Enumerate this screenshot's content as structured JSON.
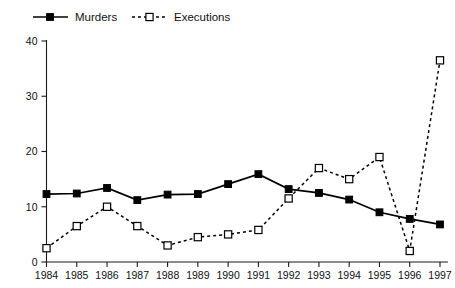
{
  "chart_data": {
    "type": "line",
    "title": "",
    "subtitle": "",
    "xlabel": "",
    "ylabel": "",
    "categories": [
      "1984",
      "1985",
      "1986",
      "1987",
      "1988",
      "1989",
      "1990",
      "1991",
      "1992",
      "1993",
      "1994",
      "1995",
      "1996",
      "1997"
    ],
    "x": [
      1984,
      1985,
      1986,
      1987,
      1988,
      1989,
      1990,
      1991,
      1992,
      1993,
      1994,
      1995,
      1996,
      1997
    ],
    "series": [
      {
        "name": "Murders",
        "marker": "filled-square",
        "linestyle": "solid",
        "values": [
          12.3,
          12.4,
          13.4,
          11.2,
          12.2,
          12.3,
          14.1,
          15.9,
          13.2,
          12.5,
          11.3,
          9.0,
          7.8,
          6.8
        ]
      },
      {
        "name": "Executions",
        "marker": "open-square",
        "linestyle": "dashed",
        "values": [
          2.5,
          6.5,
          10.0,
          6.5,
          3.0,
          4.5,
          5.0,
          5.8,
          11.5,
          17.0,
          15.0,
          19.0,
          2.0,
          36.5
        ]
      }
    ],
    "ylim": [
      0,
      40
    ],
    "yticks": [
      0,
      10,
      20,
      30,
      40
    ],
    "ytick_labels": [
      "0",
      "10",
      "20",
      "30",
      "40"
    ],
    "xlim": [
      1984,
      1997
    ],
    "grid": false,
    "legend_position": "top-left",
    "legend": [
      "Murders",
      "Executions"
    ]
  },
  "colors": {
    "series_line": "#000000",
    "axis": "#1a1a1a",
    "background": "#ffffff",
    "marker_fill_open": "#ffffff"
  }
}
